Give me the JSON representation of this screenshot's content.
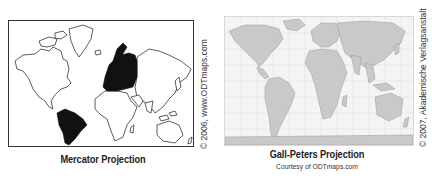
{
  "figures": [
    {
      "id": "mercator",
      "title": "Mercator Projection",
      "credit": "© 2006, www.ODTmaps.com",
      "highlighted_regions": [
        "Europe",
        "South America"
      ],
      "highlight_color": "#111111"
    },
    {
      "id": "gall-peters",
      "title": "Gall-Peters Projection",
      "subtitle": "Courtesy of ODTmaps.com",
      "credit": "© 2007, Akademische Verlagsanstalt"
    }
  ],
  "colors": {
    "outline": "#333333",
    "land_fill": "#ffffff",
    "highlight": "#111111",
    "gp_land": "#c9c9c9",
    "gp_background": "#f4f4f4"
  }
}
